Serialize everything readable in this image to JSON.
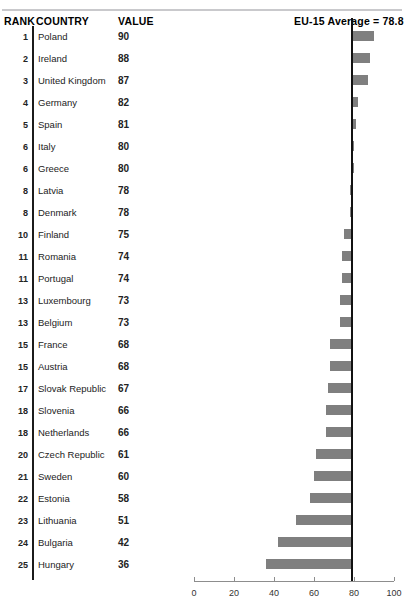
{
  "header": {
    "rank_label": "RANK",
    "country_label": "COUNTRY",
    "value_label": "VALUE",
    "average_label": "EU-15 Average = 78.8"
  },
  "colors": {
    "bar": "#7f7f7f",
    "reference_line": "#111111",
    "rule": "#c9c9cc",
    "axis": "#8d8d8d",
    "text": "#232323"
  },
  "chart_data": {
    "type": "bar",
    "title": "",
    "subtitle": "",
    "xlabel": "",
    "ylabel": "",
    "orientation": "horizontal",
    "grid": false,
    "legend": null,
    "xlim": [
      0,
      100
    ],
    "xticks": [
      0,
      20,
      40,
      60,
      80,
      100
    ],
    "xtick_labels": [
      "0",
      "20",
      "40",
      "60",
      "80",
      "100"
    ],
    "reference_value": 78.8,
    "reference_label": "EU-15 Average = 78.8",
    "baseline": 78.8,
    "categories": [
      "Poland",
      "Ireland",
      "United Kingdom",
      "Germany",
      "Spain",
      "Italy",
      "Greece",
      "Latvia",
      "Denmark",
      "Finland",
      "Romania",
      "Portugal",
      "Luxembourg",
      "Belgium",
      "France",
      "Austria",
      "Slovak Republic",
      "Slovenia",
      "Netherlands",
      "Czech Republic",
      "Sweden",
      "Estonia",
      "Lithuania",
      "Bulgaria",
      "Hungary"
    ],
    "values": [
      90,
      88,
      87,
      82,
      81,
      80,
      80,
      78,
      78,
      75,
      74,
      74,
      73,
      73,
      68,
      68,
      67,
      66,
      66,
      61,
      60,
      58,
      51,
      42,
      36
    ],
    "ranks": [
      1,
      2,
      3,
      4,
      5,
      6,
      6,
      8,
      8,
      10,
      11,
      11,
      13,
      13,
      15,
      15,
      17,
      18,
      18,
      20,
      21,
      22,
      23,
      24,
      25
    ]
  },
  "rows": [
    {
      "rank": "1",
      "country": "Poland",
      "value": "90"
    },
    {
      "rank": "2",
      "country": "Ireland",
      "value": "88"
    },
    {
      "rank": "3",
      "country": "United Kingdom",
      "value": "87"
    },
    {
      "rank": "4",
      "country": "Germany",
      "value": "82"
    },
    {
      "rank": "5",
      "country": "Spain",
      "value": "81"
    },
    {
      "rank": "6",
      "country": "Italy",
      "value": "80"
    },
    {
      "rank": "6",
      "country": "Greece",
      "value": "80"
    },
    {
      "rank": "8",
      "country": "Latvia",
      "value": "78"
    },
    {
      "rank": "8",
      "country": "Denmark",
      "value": "78"
    },
    {
      "rank": "10",
      "country": "Finland",
      "value": "75"
    },
    {
      "rank": "11",
      "country": "Romania",
      "value": "74"
    },
    {
      "rank": "11",
      "country": "Portugal",
      "value": "74"
    },
    {
      "rank": "13",
      "country": "Luxembourg",
      "value": "73"
    },
    {
      "rank": "13",
      "country": "Belgium",
      "value": "73"
    },
    {
      "rank": "15",
      "country": "France",
      "value": "68"
    },
    {
      "rank": "15",
      "country": "Austria",
      "value": "68"
    },
    {
      "rank": "17",
      "country": "Slovak Republic",
      "value": "67"
    },
    {
      "rank": "18",
      "country": "Slovenia",
      "value": "66"
    },
    {
      "rank": "18",
      "country": "Netherlands",
      "value": "66"
    },
    {
      "rank": "20",
      "country": "Czech Republic",
      "value": "61"
    },
    {
      "rank": "21",
      "country": "Sweden",
      "value": "60"
    },
    {
      "rank": "22",
      "country": "Estonia",
      "value": "58"
    },
    {
      "rank": "23",
      "country": "Lithuania",
      "value": "51"
    },
    {
      "rank": "24",
      "country": "Bulgaria",
      "value": "42"
    },
    {
      "rank": "25",
      "country": "Hungary",
      "value": "36"
    }
  ]
}
